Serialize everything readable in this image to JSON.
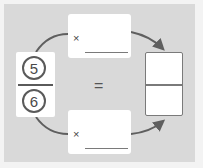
{
  "diagram": {
    "type": "equivalent-fraction",
    "start_fraction": {
      "numerator": "5",
      "denominator": "6"
    },
    "top_operation": {
      "operator": "×",
      "value": ""
    },
    "bottom_operation": {
      "operator": "×",
      "value": ""
    },
    "equals": "=",
    "result_fraction": {
      "numerator": "",
      "denominator": ""
    }
  },
  "colors": {
    "background": "#f3f3f3",
    "panel": "#d9d9d9",
    "box": "#ffffff",
    "arrow": "#5f5f5f",
    "line": "#7a7a7a"
  }
}
